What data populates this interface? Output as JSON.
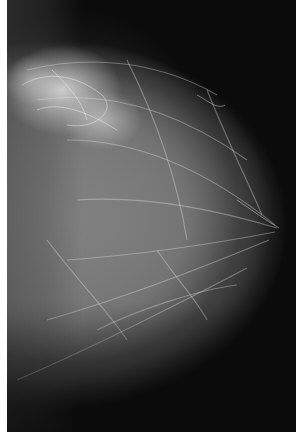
{
  "image": {
    "subject": "mammogram",
    "view": "craniocaudal breast radiograph, nipple pointing right",
    "colors": {
      "background": "#0b0b0b",
      "tissue": "#8c8c8c",
      "dense_tissue": "#e1e1e1",
      "border": "#ffffff"
    }
  }
}
